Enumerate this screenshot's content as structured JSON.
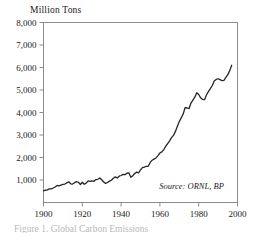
{
  "figure": {
    "axis_title": "Million Tons",
    "caption_clipped": "Figure 1. Global Carbon Emissions",
    "source_note": "Source: ORNL, BP",
    "frame_color": "#8c8c8c",
    "line_color": "#262626",
    "background": "#ffffff"
  },
  "chart_data": {
    "type": "line",
    "title": "",
    "xlabel": "",
    "ylabel": "Million Tons",
    "xlim": [
      1900,
      2000
    ],
    "ylim": [
      0,
      8000
    ],
    "xticks": [
      1900,
      1920,
      1940,
      1960,
      1980,
      2000
    ],
    "yticks": [
      1000,
      2000,
      3000,
      4000,
      5000,
      6000,
      7000,
      8000
    ],
    "ytick_labels": [
      "1,000",
      "2,000",
      "3,000",
      "4,000",
      "5,000",
      "6,000",
      "7,000",
      "8,000"
    ],
    "xtick_labels": [
      "1900",
      "1920",
      "1940",
      "1960",
      "1980",
      "2000"
    ],
    "grid": false,
    "legend": false,
    "annotations": [
      {
        "text": "Source: ORNL, BP",
        "x": 1993,
        "y": 620,
        "style": "italic"
      }
    ],
    "series": [
      {
        "name": "Global carbon emissions",
        "x": [
          1900,
          1901,
          1902,
          1903,
          1904,
          1905,
          1906,
          1907,
          1908,
          1909,
          1910,
          1911,
          1912,
          1913,
          1914,
          1915,
          1916,
          1917,
          1918,
          1919,
          1920,
          1921,
          1922,
          1923,
          1924,
          1925,
          1926,
          1927,
          1928,
          1929,
          1930,
          1931,
          1932,
          1933,
          1934,
          1935,
          1936,
          1937,
          1938,
          1939,
          1940,
          1941,
          1942,
          1943,
          1944,
          1945,
          1946,
          1947,
          1948,
          1949,
          1950,
          1951,
          1952,
          1953,
          1954,
          1955,
          1956,
          1957,
          1958,
          1959,
          1960,
          1961,
          1962,
          1963,
          1964,
          1965,
          1966,
          1967,
          1968,
          1969,
          1970,
          1971,
          1972,
          1973,
          1974,
          1975,
          1976,
          1977,
          1978,
          1979,
          1980,
          1981,
          1982,
          1983,
          1984,
          1985,
          1986,
          1987,
          1988,
          1989,
          1990,
          1991,
          1992,
          1993,
          1994,
          1995,
          1996,
          1997
        ],
        "values": [
          520,
          545,
          560,
          605,
          610,
          645,
          690,
          760,
          735,
          770,
          805,
          820,
          870,
          920,
          830,
          820,
          880,
          925,
          900,
          800,
          900,
          810,
          860,
          960,
          940,
          960,
          940,
          1020,
          1030,
          1090,
          1010,
          910,
          850,
          890,
          950,
          990,
          1080,
          1140,
          1090,
          1170,
          1200,
          1250,
          1240,
          1300,
          1320,
          1120,
          1190,
          1290,
          1350,
          1310,
          1450,
          1550,
          1570,
          1610,
          1610,
          1780,
          1880,
          1930,
          1980,
          2080,
          2200,
          2250,
          2350,
          2500,
          2620,
          2740,
          2880,
          2980,
          3160,
          3390,
          3600,
          3760,
          3930,
          4220,
          4200,
          4170,
          4420,
          4550,
          4680,
          4880,
          4800,
          4650,
          4580,
          4570,
          4780,
          4930,
          5060,
          5200,
          5400,
          5470,
          5500,
          5460,
          5420,
          5430,
          5560,
          5680,
          5860,
          6100
        ]
      }
    ]
  }
}
